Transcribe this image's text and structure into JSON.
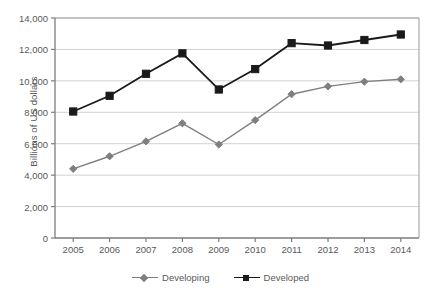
{
  "chart_data": {
    "type": "line",
    "title": "",
    "xlabel": "",
    "ylabel": "Billions of US dollars",
    "categories": [
      "2005",
      "2006",
      "2007",
      "2008",
      "2009",
      "2010",
      "2011",
      "2012",
      "2013",
      "2014"
    ],
    "ylim": [
      0,
      14000
    ],
    "ytick_labels": [
      "0",
      "2,000",
      "4,000",
      "6,000",
      "8,000",
      "10,000",
      "12,000",
      "14,000"
    ],
    "ytick_values": [
      0,
      2000,
      4000,
      6000,
      8000,
      10000,
      12000,
      14000
    ],
    "grid": "horizontal",
    "legend_position": "bottom",
    "series": [
      {
        "name": "Developing",
        "color": "#7f7f7f",
        "marker": "diamond",
        "values": [
          4400,
          5200,
          6150,
          7300,
          5950,
          7500,
          9150,
          9650,
          9950,
          10100
        ]
      },
      {
        "name": "Developed",
        "color": "#1a1a1a",
        "marker": "square",
        "values": [
          8050,
          9050,
          10450,
          11750,
          9450,
          10750,
          12400,
          12250,
          12600,
          12950
        ]
      }
    ]
  },
  "legend": {
    "items": [
      {
        "label": "Developing",
        "color": "#7f7f7f",
        "marker": "diamond"
      },
      {
        "label": "Developed",
        "color": "#1a1a1a",
        "marker": "square"
      }
    ]
  },
  "colors": {
    "developing": "#7f7f7f",
    "developed": "#1a1a1a",
    "grid": "#d2d2d2",
    "axis": "#8a8a8a",
    "text": "#595959",
    "background": "#ffffff"
  }
}
